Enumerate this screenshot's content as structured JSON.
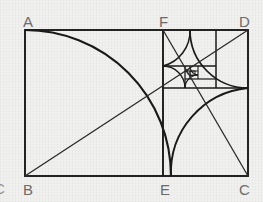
{
  "figure": {
    "background_color": "#f1f1ef",
    "stroke_color": "#1a1a1a",
    "label_color": "#6d6d6d",
    "canvas": {
      "width": 263,
      "height": 202
    }
  },
  "labels": {
    "a": "A",
    "b": "B",
    "c": "C",
    "d": "D",
    "e": "E",
    "f": "F",
    "clipped_left": "C"
  },
  "geometry": {
    "outer_rect": {
      "x": 25,
      "y": 30,
      "width": 223,
      "height": 146
    },
    "vertical_divider_x": 163,
    "horizontal_divider_y": 88,
    "spiral_center": {
      "x": 189,
      "y": 68
    },
    "ratio": 1.527,
    "squares": [
      {
        "name": "square-1-BEFA",
        "x": 25,
        "y": 30,
        "size": 146
      },
      {
        "name": "square-2-FDxx",
        "x": 163,
        "y": 30,
        "size": 85
      },
      {
        "name": "square-3",
        "x": 163,
        "y": 115,
        "size": 52
      },
      {
        "name": "square-4",
        "x": 196,
        "y": 115,
        "size": 33
      },
      {
        "name": "square-5",
        "x": 196,
        "y": 95,
        "size": 20
      },
      {
        "name": "square-6",
        "x": 183,
        "y": 95,
        "size": 13
      },
      {
        "name": "square-7",
        "x": 183,
        "y": 87,
        "size": 8
      },
      {
        "name": "square-8",
        "x": 188,
        "y": 87,
        "size": 5
      }
    ],
    "diagonals": [
      {
        "name": "diagonal-B-D",
        "from": "B",
        "to": "D"
      },
      {
        "name": "diagonal-F-C",
        "from": "F",
        "to": "C"
      }
    ],
    "spiral_description": "Fibonacci quarter-circle arcs inscribed in nested golden-ratio squares"
  }
}
